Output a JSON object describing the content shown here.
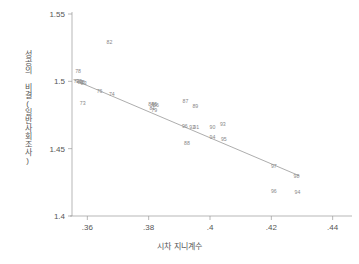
{
  "chart_data": {
    "type": "scatter",
    "title": "",
    "subtitle": "",
    "xlabel": "시차 지니계수",
    "ylabel": "성공의 비결(일반사회조사)",
    "xlim": [
      0.355,
      0.445
    ],
    "ylim": [
      1.4,
      1.55
    ],
    "xticks": [
      0.36,
      0.38,
      0.4,
      0.42,
      0.44
    ],
    "xticklabels": [
      ".36",
      ".38",
      ".4",
      ".42",
      ".44"
    ],
    "yticks": [
      1.4,
      1.45,
      1.5,
      1.55
    ],
    "yticklabels": [
      "1.4",
      "1.45",
      "1.5",
      "1.55"
    ],
    "grid": false,
    "legend": "none",
    "marker_style": "text-label",
    "marker_color": "#888888",
    "line_color": "#8a8a8a",
    "points": [
      {
        "label": "72",
        "x": 0.3565,
        "y": 1.5005
      },
      {
        "label": "78",
        "x": 0.357,
        "y": 1.5075
      },
      {
        "label": "77",
        "x": 0.3572,
        "y": 1.5002
      },
      {
        "label": "80",
        "x": 0.3578,
        "y": 1.4998
      },
      {
        "label": "75",
        "x": 0.3583,
        "y": 1.4993
      },
      {
        "label": "83",
        "x": 0.3588,
        "y": 1.4988
      },
      {
        "label": "73",
        "x": 0.3585,
        "y": 1.4838
      },
      {
        "label": "76",
        "x": 0.364,
        "y": 1.493
      },
      {
        "label": "74",
        "x": 0.368,
        "y": 1.4905
      },
      {
        "label": "82",
        "x": 0.3672,
        "y": 1.529
      },
      {
        "label": "84",
        "x": 0.3808,
        "y": 1.483
      },
      {
        "label": "85",
        "x": 0.3818,
        "y": 1.4833
      },
      {
        "label": "86",
        "x": 0.3824,
        "y": 1.4828
      },
      {
        "label": "81",
        "x": 0.3812,
        "y": 1.48
      },
      {
        "label": "79",
        "x": 0.3818,
        "y": 1.4788
      },
      {
        "label": "87",
        "x": 0.392,
        "y": 1.4855
      },
      {
        "label": "89",
        "x": 0.3952,
        "y": 1.482
      },
      {
        "label": "96b",
        "x": 0.3918,
        "y": 1.4672
      },
      {
        "label": "92",
        "x": 0.3942,
        "y": 1.466
      },
      {
        "label": "91",
        "x": 0.3955,
        "y": 1.4665
      },
      {
        "label": "88",
        "x": 0.3925,
        "y": 1.454
      },
      {
        "label": "90",
        "x": 0.4008,
        "y": 1.4665
      },
      {
        "label": "93",
        "x": 0.4042,
        "y": 1.4685
      },
      {
        "label": "94b",
        "x": 0.4008,
        "y": 1.459
      },
      {
        "label": "95",
        "x": 0.4045,
        "y": 1.4572
      },
      {
        "label": "97",
        "x": 0.4208,
        "y": 1.4375
      },
      {
        "label": "98",
        "x": 0.4282,
        "y": 1.43
      },
      {
        "label": "96",
        "x": 0.4208,
        "y": 1.4185
      },
      {
        "label": "94",
        "x": 0.4285,
        "y": 1.418
      }
    ],
    "fit_line": {
      "type": "linear-fit",
      "x_start": 0.3555,
      "y_start": 1.5012,
      "x_end": 0.4292,
      "y_end": 1.4298
    }
  }
}
